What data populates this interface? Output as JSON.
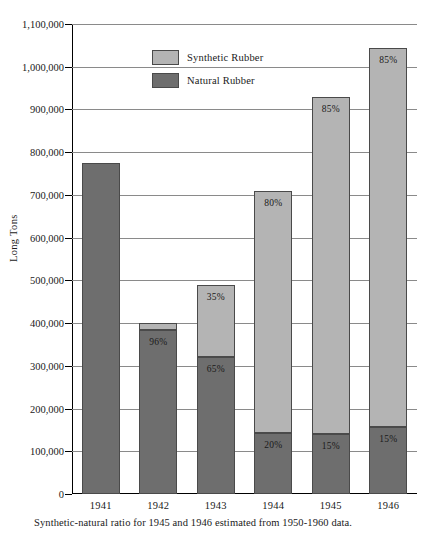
{
  "chart_data": {
    "type": "bar",
    "subtype": "stacked",
    "title": "",
    "xlabel": "",
    "ylabel": "Long Tons",
    "ylim": [
      0,
      1100000
    ],
    "ytick_values": [
      0,
      100000,
      200000,
      300000,
      400000,
      500000,
      600000,
      700000,
      800000,
      900000,
      1000000,
      1100000
    ],
    "ytick_labels": [
      "0",
      "100,000",
      "200,000",
      "300,000",
      "400,000",
      "500,000",
      "600,000",
      "700,000",
      "800,000",
      "900,000",
      "1,000,000",
      "1,100,000"
    ],
    "grid": true,
    "legend_position": "top-center",
    "categories": [
      "1941",
      "1942",
      "1943",
      "1944",
      "1945",
      "1946"
    ],
    "series": [
      {
        "name": "Natural Rubber",
        "color": "#6e6e6e",
        "values": [
          775000,
          384000,
          320000,
          142000,
          140000,
          157000
        ],
        "labels": [
          "",
          "96%",
          "65%",
          "20%",
          "15%",
          "15%"
        ]
      },
      {
        "name": "Synthetic Rubber",
        "color": "#b4b4b4",
        "values": [
          0,
          16000,
          170000,
          568000,
          790000,
          888000
        ],
        "labels": [
          "",
          "",
          "35%",
          "80%",
          "85%",
          "85%"
        ]
      }
    ],
    "totals": [
      775000,
      400000,
      490000,
      710000,
      930000,
      1045000
    ],
    "annotation": "Synthetic-natural ratio for 1945 and 1946 estimated from 1950-1960 data."
  },
  "legend": {
    "items": [
      {
        "label": "Synthetic Rubber",
        "swatch_name": "legend-swatch-synthetic"
      },
      {
        "label": "Natural Rubber",
        "swatch_name": "legend-swatch-natural"
      }
    ]
  },
  "axes": {
    "y_title": "Long Tons"
  },
  "caption": {
    "text": "Synthetic-natural ratio for 1945 and 1946 estimated from 1950-1960 data."
  },
  "colors": {
    "natural": "#6e6e6e",
    "synthetic": "#b4b4b4",
    "gridline": "#8a8a8a",
    "axis": "#000000",
    "background": "#ffffff"
  }
}
